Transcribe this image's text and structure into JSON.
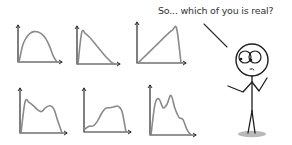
{
  "speech": {
    "text": "So... which of you is real?"
  },
  "colors": {
    "ink": "#2a2a2a",
    "curve": "#8a8a8a",
    "shadow": "#9a9a9a",
    "background": "#ffffff"
  },
  "chart_data": [
    {
      "type": "line",
      "title": "",
      "shape": "single hump (symmetric)",
      "x": [
        0,
        1,
        2,
        3,
        4,
        5,
        6,
        7,
        8,
        9,
        10
      ],
      "values": [
        0,
        55,
        80,
        93,
        98,
        97,
        90,
        76,
        52,
        20,
        0
      ]
    },
    {
      "type": "line",
      "title": "",
      "shape": "early peak, long right tail",
      "x": [
        0,
        1,
        2,
        3,
        4,
        5,
        6,
        7,
        8,
        9,
        10
      ],
      "values": [
        0,
        98,
        95,
        85,
        72,
        58,
        44,
        30,
        17,
        6,
        0
      ]
    },
    {
      "type": "line",
      "title": "",
      "shape": "rising ramp, sharp drop",
      "x": [
        0,
        1,
        2,
        3,
        4,
        5,
        6,
        7,
        8,
        9,
        10
      ],
      "values": [
        0,
        12,
        24,
        36,
        48,
        60,
        72,
        84,
        94,
        98,
        0
      ]
    },
    {
      "type": "line",
      "title": "",
      "shape": "bimodal",
      "x": [
        0,
        1,
        2,
        3,
        4,
        5,
        6,
        7,
        8,
        9,
        10
      ],
      "values": [
        0,
        80,
        78,
        70,
        60,
        55,
        65,
        70,
        62,
        30,
        0
      ]
    },
    {
      "type": "line",
      "title": "",
      "shape": "late peak with bumps",
      "x": [
        0,
        1,
        2,
        3,
        4,
        5,
        6,
        7,
        8,
        9,
        10
      ],
      "values": [
        8,
        15,
        16,
        28,
        48,
        62,
        64,
        66,
        68,
        55,
        0
      ]
    },
    {
      "type": "line",
      "title": "",
      "shape": "bimodal with right shoulder",
      "x": [
        0,
        1,
        2,
        3,
        4,
        5,
        6,
        7,
        8,
        9,
        10
      ],
      "values": [
        0,
        70,
        82,
        62,
        70,
        90,
        60,
        40,
        35,
        12,
        0
      ]
    }
  ]
}
